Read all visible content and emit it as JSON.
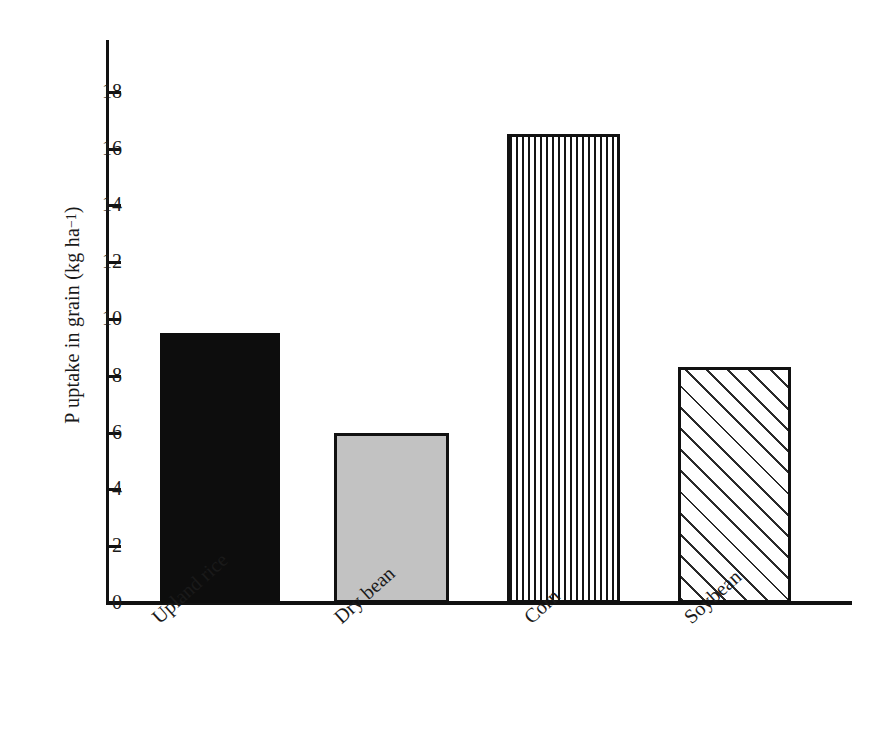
{
  "chart_data": {
    "type": "bar",
    "title": "",
    "subtitle": "",
    "xlabel": "",
    "ylabel": "P uptake in grain (kg ha⁻¹)",
    "ylabel_parts": {
      "base": "P uptake in grain (kg ha",
      "superscript": "−1",
      "tail": ")"
    },
    "categories": [
      "Upland rice",
      "Dry bean",
      "Corn",
      "Soybean"
    ],
    "values": [
      9.5,
      6.0,
      16.5,
      8.3
    ],
    "ylim": [
      0,
      19
    ],
    "xlim_note": "categorical",
    "ytick_labels": [
      "0",
      "2",
      "4",
      "6",
      "8",
      "10",
      "12",
      "14",
      "16",
      "18"
    ],
    "ytick_values": [
      0,
      2,
      4,
      6,
      8,
      10,
      12,
      14,
      16,
      18
    ],
    "grid": false,
    "legend": false,
    "legend_position": "none",
    "bar_fills": [
      "solid-black",
      "solid-gray",
      "vertical-stripes",
      "diagonal-hatch"
    ],
    "colors": {
      "upland_rice": "#0d0d0d",
      "dry_bean": "#c2c2c2",
      "corn_stripe": "#141414",
      "soybean_hatch": "#2b2b2b",
      "axis": "#111111",
      "background": "#ffffff",
      "text": "#1a1a1a"
    },
    "category_label_rotation_deg": -42
  }
}
